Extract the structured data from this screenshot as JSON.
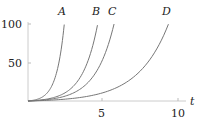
{
  "chart_data": {
    "type": "line",
    "title": "",
    "xlabel": "t",
    "ylabel": "",
    "xlim": [
      0,
      11
    ],
    "ylim": [
      0,
      100
    ],
    "xticks": [
      5,
      10
    ],
    "yticks": [
      50,
      100
    ],
    "grid": false,
    "legend": "curve labels at top of each curve",
    "series": [
      {
        "name": "A",
        "formula": "exp(1.92 t) - 1",
        "k": 1.92,
        "t_end": 2.4
      },
      {
        "name": "B",
        "formula": "exp(1.0 t) - 1",
        "k": 1.0,
        "t_end": 4.6
      },
      {
        "name": "C",
        "formula": "exp(0.81 t) - 1",
        "k": 0.81,
        "t_end": 5.7
      },
      {
        "name": "D",
        "formula": "exp(0.5 t) - 1",
        "k": 0.496,
        "t_end": 9.3
      }
    ]
  },
  "labels": {
    "x_axis": "t",
    "xtick_5": "5",
    "xtick_10": "10",
    "ytick_50": "50",
    "ytick_100": "100",
    "curve_A": "A",
    "curve_B": "B",
    "curve_C": "C",
    "curve_D": "D"
  }
}
